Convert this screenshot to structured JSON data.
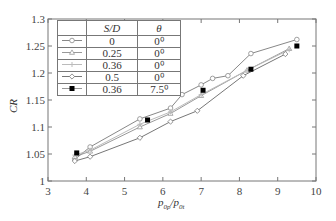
{
  "chart_data": {
    "type": "line",
    "title": "",
    "xlabel": "p0p/p0t",
    "ylabel": "CR",
    "xlim": [
      3,
      10
    ],
    "ylim": [
      1.0,
      1.3
    ],
    "xticks": [
      3,
      4,
      5,
      6,
      7,
      8,
      9,
      10
    ],
    "yticks": [
      1,
      1.05,
      1.1,
      1.15,
      1.2,
      1.25,
      1.3
    ],
    "ytick_labels": [
      "1",
      "1.05",
      "1.1",
      "1.15",
      "1.2",
      "1.25",
      "1.3"
    ],
    "grid": false,
    "legend_position": "upper left (table)",
    "legend_headers": [
      "",
      "S/D",
      "θ"
    ],
    "series": [
      {
        "name": "S/D=0, θ=0°",
        "sd": "0",
        "theta": "0⁰",
        "marker": "open-circle",
        "color": "#888888",
        "x": [
          3.7,
          4.1,
          5.4,
          6.2,
          6.5,
          7.0,
          7.3,
          7.7,
          8.3,
          9.5
        ],
        "y": [
          1.04,
          1.063,
          1.115,
          1.135,
          1.16,
          1.178,
          1.19,
          1.195,
          1.236,
          1.262
        ]
      },
      {
        "name": "S/D=0.25, θ=0°",
        "sd": "0.25",
        "theta": "0⁰",
        "marker": "open-triangle",
        "color": "#999999",
        "x": [
          3.7,
          4.1,
          5.4,
          6.2,
          7.0,
          8.2,
          9.3
        ],
        "y": [
          1.045,
          1.055,
          1.1,
          1.125,
          1.158,
          1.205,
          1.245
        ]
      },
      {
        "name": "S/D=0.36, θ=0°",
        "sd": "0.36",
        "theta": "0⁰",
        "marker": "plus",
        "color": "#bbbbbb",
        "x": [
          3.7,
          4.1,
          5.4,
          6.2,
          7.0,
          8.2,
          9.3
        ],
        "y": [
          1.048,
          1.057,
          1.105,
          1.128,
          1.16,
          1.205,
          1.243
        ]
      },
      {
        "name": "S/D=0.5, θ=0°",
        "sd": "0.5",
        "theta": "0⁰",
        "marker": "open-diamond",
        "color": "#777777",
        "x": [
          3.7,
          4.1,
          5.4,
          6.2,
          6.9,
          8.1,
          9.2
        ],
        "y": [
          1.037,
          1.045,
          1.08,
          1.11,
          1.13,
          1.195,
          1.235
        ]
      },
      {
        "name": "S/D=0.36, θ=7.5°",
        "sd": "0.36",
        "theta": "7.5⁰",
        "marker": "filled-square",
        "color": "#000000",
        "x": [
          3.75,
          5.6,
          7.05,
          8.3,
          9.5
        ],
        "y": [
          1.052,
          1.113,
          1.168,
          1.207,
          1.25
        ]
      }
    ]
  }
}
